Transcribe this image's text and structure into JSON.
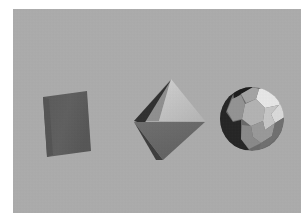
{
  "scene": {
    "title": "3D geometric primitives render",
    "canvas": {
      "width": 306,
      "height": 221
    },
    "border_color": "#ffffff",
    "background_color": "#adadad",
    "panel": {
      "x": 13,
      "y": 9,
      "width": 288,
      "height": 204
    },
    "lighting": {
      "direction": "upper-right",
      "ambient": "low"
    },
    "objects": [
      {
        "id": "parallelogram",
        "name": "flat-parallelogram",
        "label": "Parallelogram",
        "shape": "quadrilateral",
        "center": {
          "x": 68,
          "y": 113
        },
        "fill": "#5c5c5c",
        "shade": "uniform-dark",
        "points": "30,88 74,82 78,142 34,148"
      },
      {
        "id": "octahedron",
        "name": "octahedron",
        "label": "Octahedron",
        "shape": "bipyramid",
        "center": {
          "x": 155,
          "y": 108
        },
        "apex": {
          "x": 158,
          "y": 70
        },
        "faces": [
          {
            "name": "top-left-face",
            "fill": "#8f8f8f",
            "points": "158,70 122,112 144,112"
          },
          {
            "name": "top-right-face",
            "fill": "#c2c2c2",
            "points": "158,70 144,112 192,112"
          },
          {
            "name": "left-edge-face",
            "fill": "#3a3a3a",
            "points": "158,70 122,112 132,116"
          },
          {
            "name": "bottom-left-face",
            "fill": "#3f3f3f",
            "points": "122,112 150,150 140,150"
          },
          {
            "name": "bottom-front-face",
            "fill": "#6a6a6a",
            "points": "122,112 192,112 150,150"
          }
        ]
      },
      {
        "id": "soccer-ball",
        "name": "truncated-icosahedron",
        "label": "Truncated icosahedron",
        "shape": "buckyball",
        "center": {
          "x": 239,
          "y": 110
        },
        "radius": 32,
        "faces": [
          {
            "name": "highlight-hexagon-top-right",
            "fill": "#e8e8e8",
            "points": "246,80 258,76 268,84 266,96 252,99 243,91"
          },
          {
            "name": "hexagon-right",
            "fill": "#dedede",
            "points": "266,96 268,84 271,92 270,108 262,114 258,105"
          },
          {
            "name": "pentagon-top",
            "fill": "#a8a8a8",
            "points": "228,84 240,78 246,80 243,91 233,94"
          },
          {
            "name": "hexagon-center-upper",
            "fill": "#b5b5b5",
            "points": "243,91 252,99 250,112 238,117 229,110 231,96"
          },
          {
            "name": "hexagon-upper-left",
            "fill": "#989898",
            "points": "231,96 229,110 220,112 214,102 218,90 228,86"
          },
          {
            "name": "hexagon-center-right",
            "fill": "#cacaca",
            "points": "252,99 266,96 258,105 262,114 252,121 250,112"
          },
          {
            "name": "hexagon-lower-right",
            "fill": "#9b9b9b",
            "points": "250,112 252,121 262,114 259,126 248,134 240,128 238,117"
          },
          {
            "name": "pentagon-bottom",
            "fill": "#8c8c8c",
            "points": "238,117 240,128 248,134 236,139 228,130 229,118"
          },
          {
            "name": "shadow-left-crescent",
            "fill": "#232323",
            "points": "214,102 220,112 229,110 229,118 228,130 236,139 224,138 213,128 208,114 209,102"
          },
          {
            "name": "shadow-upper-left-arc",
            "fill": "#303030",
            "points": "218,90 214,102 209,102 212,90 220,82 228,79 228,86"
          },
          {
            "name": "shadow-hook-top",
            "fill": "#1e1e1e",
            "points": "220,82 232,77 240,78 228,84 222,88"
          },
          {
            "name": "rim-shadow-bottom-right",
            "fill": "#6f6f6f",
            "points": "248,134 259,126 262,114 270,108 266,122 256,134 246,140"
          }
        ]
      }
    ]
  }
}
